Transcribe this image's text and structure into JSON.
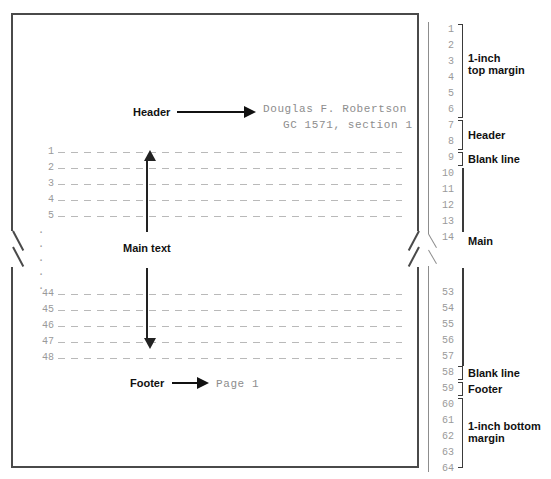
{
  "diagram": {
    "page_text": {
      "header_line1": "Douglas F. Robertson",
      "header_line2": "GC 1571, section 1",
      "footer_line": "Page 1"
    },
    "callouts": {
      "header": "Header",
      "main_text": "Main text",
      "footer": "Footer"
    },
    "left_line_numbers": [
      "1",
      "2",
      "3",
      "4",
      "5",
      "44",
      "45",
      "46",
      "47",
      "48"
    ],
    "left_ellipsis": [
      "·",
      "·",
      "·",
      "·",
      "·"
    ],
    "ruler_numbers_top": [
      "1",
      "2",
      "3",
      "4",
      "5",
      "6",
      "7",
      "8",
      "9",
      "10",
      "11",
      "12",
      "13",
      "14"
    ],
    "ruler_numbers_bottom": [
      "53",
      "54",
      "55",
      "56",
      "57",
      "58",
      "59",
      "60",
      "61",
      "62",
      "63",
      "64",
      "65",
      "66"
    ],
    "ruler_labels": {
      "top_margin": "1-inch\ntop margin",
      "header": "Header",
      "blank_line_top": "Blank line",
      "main": "Main",
      "blank_line_bottom": "Blank line",
      "footer": "Footer",
      "bottom_margin": "1-inch bottom\nmargin"
    },
    "colors": {
      "sheet_border": "#4a4a4a",
      "dashed_line": "#b9b9b9",
      "number_gray": "#9a9a9a",
      "label_black": "#111111",
      "mono_gray": "#8d8d8d",
      "background": "#ffffff"
    }
  }
}
